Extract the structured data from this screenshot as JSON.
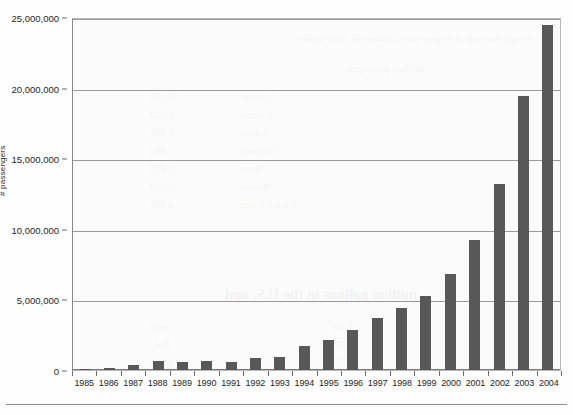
{
  "chart_data": {
    "type": "bar",
    "title": "",
    "xlabel": "",
    "ylabel": "# passengers",
    "ylim": [
      0,
      25000000
    ],
    "ytick_values": [
      0,
      5000000,
      10000000,
      15000000,
      20000000,
      25000000
    ],
    "ytick_labels": [
      "0",
      "5,000,000",
      "10,000,000",
      "15,000,000",
      "20,000,000",
      "25,000,000"
    ],
    "grid": true,
    "legend": "none",
    "bar_color": "#585858",
    "categories": [
      "1985",
      "1986",
      "1987",
      "1988",
      "1989",
      "1990",
      "1991",
      "1992",
      "1993",
      "1994",
      "1995",
      "1996",
      "1997",
      "1998",
      "1999",
      "2000",
      "2001",
      "2002",
      "2003",
      "2004"
    ],
    "values": [
      60000,
      130000,
      320000,
      620000,
      580000,
      650000,
      570000,
      870000,
      950000,
      1700000,
      2150000,
      2800000,
      3650000,
      4400000,
      5250000,
      6800000,
      9200000,
      13200000,
      19400000,
      24400000
    ]
  },
  "axis": {
    "y_title": "# passengers"
  },
  "ghost_text": {
    "heading_band": "the right-hand side of the page shows tabulated air traffic figures",
    "subheading": "million passengers",
    "big_line": "million gallons in the U.S. and",
    "rows": [
      "Country",
      "Canada",
      "France",
      "Germany",
      "Japan",
      "Mexico",
      "United States",
      "total",
      "Italy",
      "Spain"
    ],
    "numbers": [
      "11,220",
      "8,410",
      "6,930",
      "5,460",
      "4,870",
      "3,250",
      "2,180",
      "1,940",
      "1,120",
      "870"
    ]
  }
}
